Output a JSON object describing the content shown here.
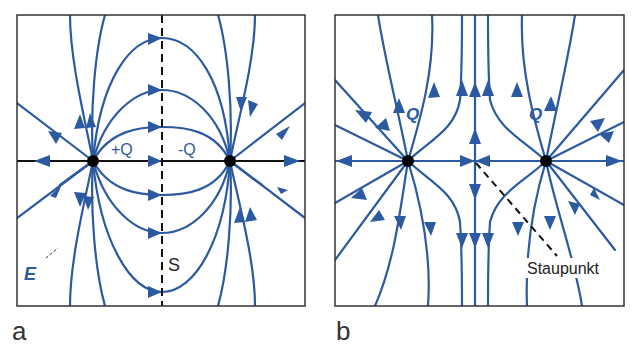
{
  "figure": {
    "colors": {
      "field_line": "#2c5aa0",
      "charge": "#000000",
      "frame": "#333333",
      "text_dark": "#222222"
    },
    "panel_a": {
      "label": "a",
      "charge_pos_label": "+Q",
      "charge_neg_label": "-Q",
      "symmetry_plane_label": "S",
      "field_label": "E",
      "description": "Electric dipole field lines between +Q and -Q with symmetry plane S"
    },
    "panel_b": {
      "label": "b",
      "charge_left_label": "Q",
      "charge_right_label": "Q",
      "stagnation_label": "Staupunkt",
      "description": "Field lines of two equal charges Q with stagnation point between them"
    }
  }
}
